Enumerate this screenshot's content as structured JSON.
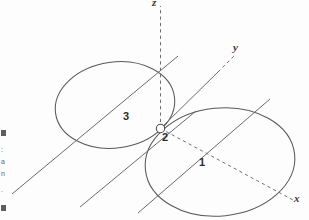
{
  "figure": {
    "type": "geometry-diagram",
    "background_color": "#fdfdfd",
    "stroke_color": "#555555",
    "label_color": "#2e2e2e",
    "width": 309,
    "height": 220
  },
  "axes": [
    {
      "name": "z-axis",
      "label": "z",
      "style": "dashed",
      "label_x": 155,
      "label_y": -2
    },
    {
      "name": "y-axis",
      "label": "y",
      "style": "solid-then-dashed",
      "label_x": 235,
      "label_y": 48
    },
    {
      "name": "x-axis",
      "label": "x",
      "style": "dashed",
      "label_x": 296,
      "label_y": 199
    }
  ],
  "regions": [
    {
      "name": "region-1",
      "label": "1",
      "x": 201,
      "y": 163
    },
    {
      "name": "region-2",
      "label": "2",
      "x": 164,
      "y": 138
    },
    {
      "name": "region-3",
      "label": "3",
      "x": 125,
      "y": 117
    }
  ],
  "origin": {
    "name": "origin-point",
    "cx": 160.5,
    "cy": 128.5,
    "r": 4.2
  },
  "ellipses": [
    {
      "name": "left-ellipse",
      "cx": 115,
      "cy": 105,
      "rx": 60,
      "ry": 43,
      "rotate": -8
    },
    {
      "name": "right-ellipse",
      "cx": 220,
      "cy": 162,
      "rx": 75,
      "ry": 54,
      "rotate": -6
    }
  ],
  "generator_lines": [
    {
      "name": "generator-line-1",
      "x1": 12,
      "y1": 194,
      "x2": 178,
      "y2": 56
    },
    {
      "name": "generator-line-2",
      "x1": 80,
      "y1": 207,
      "x2": 196,
      "y2": 111
    },
    {
      "name": "generator-line-3",
      "x1": 138,
      "y1": 213,
      "x2": 270,
      "y2": 99
    }
  ],
  "margin": {
    "note": "cropped page-margin fragments at the left edge",
    "fragments": [
      "■",
      ":",
      "a",
      "n",
      ".",
      "■"
    ]
  }
}
